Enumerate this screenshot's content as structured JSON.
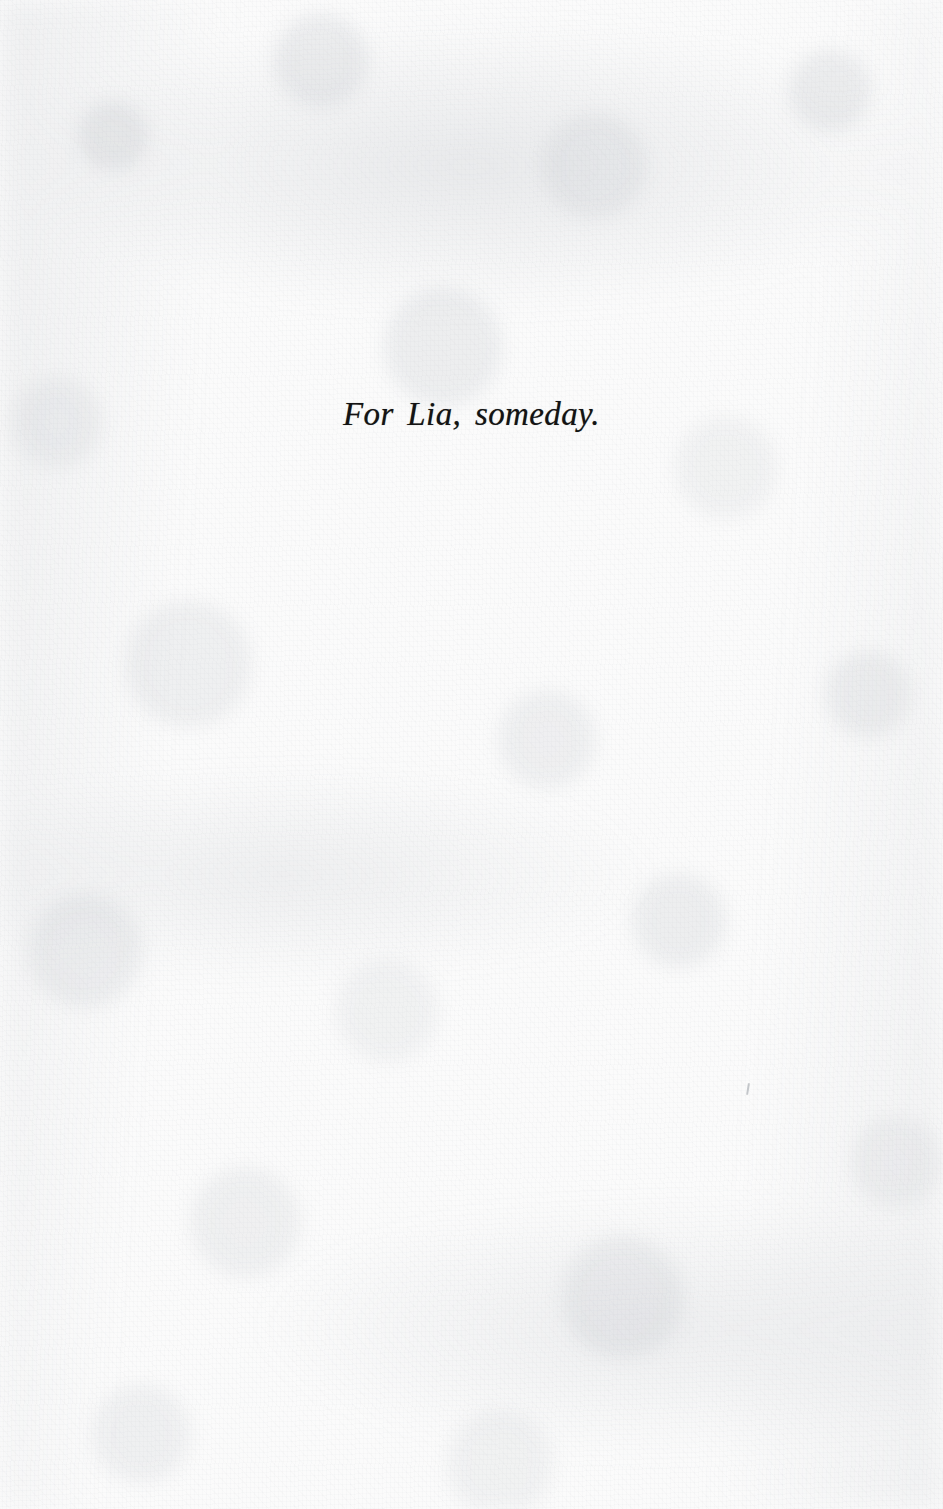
{
  "page": {
    "kind": "book-dedication-page",
    "background_color": "#fbfbfb",
    "text_color": "#131313",
    "width": 943,
    "height": 1509
  },
  "dedication": {
    "text": "For Lia, someday."
  },
  "artifacts": {
    "speck_label": ""
  }
}
